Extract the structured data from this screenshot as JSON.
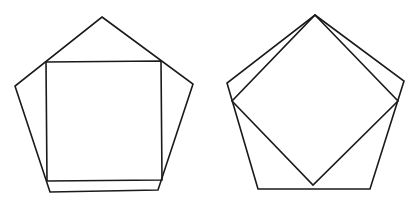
{
  "canvas": {
    "width": 417,
    "height": 203,
    "background": "#ffffff"
  },
  "style": {
    "stroke": "#1a1a1a"
  },
  "figures": [
    {
      "name": "figure-left",
      "description": "Regular pentagon with an axis-aligned square inscribed (square top corners on upper pentagon sides)",
      "pentagon": {
        "points": [
          [
            102,
            17
          ],
          [
            193,
            84
          ],
          [
            158,
            190
          ],
          [
            50,
            192
          ],
          [
            15,
            86
          ]
        ]
      },
      "square": {
        "points": [
          [
            46,
            62
          ],
          [
            161,
            61
          ],
          [
            162,
            180
          ],
          [
            47,
            181
          ]
        ]
      }
    },
    {
      "name": "figure-right",
      "description": "Regular pentagon with a rotated square (diamond) inscribed, sharing the pentagon apex",
      "pentagon": {
        "points": [
          [
            315,
            15
          ],
          [
            404,
            81
          ],
          [
            370,
            189
          ],
          [
            258,
            189
          ],
          [
            227,
            83
          ]
        ]
      },
      "square": {
        "points": [
          [
            315,
            15
          ],
          [
            398,
            101
          ],
          [
            313,
            185
          ],
          [
            232,
            101
          ]
        ]
      }
    }
  ]
}
